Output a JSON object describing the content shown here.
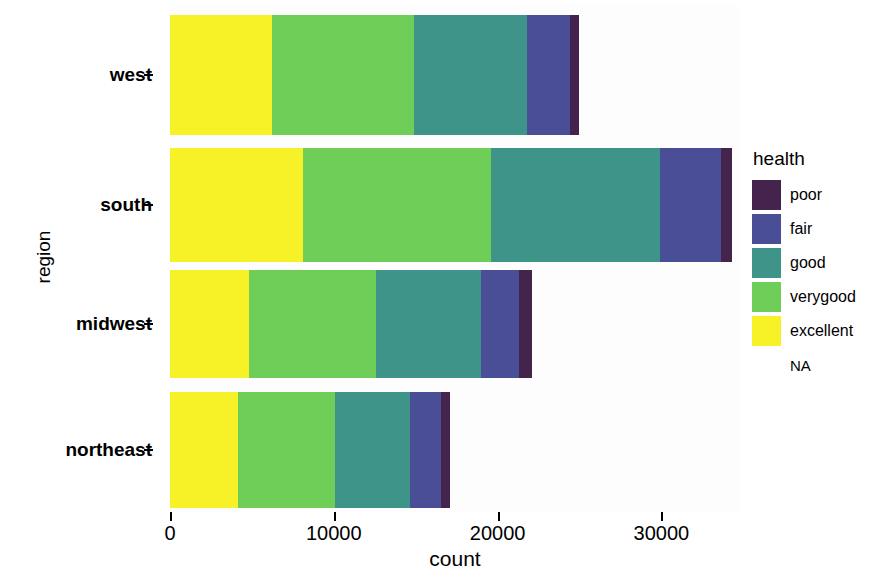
{
  "chart_data": {
    "type": "bar",
    "orientation": "horizontal",
    "stacked": true,
    "title": "",
    "xlabel": "count",
    "ylabel": "region",
    "categories": [
      "west",
      "south",
      "midwest",
      "northeast"
    ],
    "xlim": [
      0,
      34800
    ],
    "xticks": [
      0,
      10000,
      20000,
      30000
    ],
    "xtick_labels": [
      "0",
      "10000",
      "20000",
      "30000"
    ],
    "grid": false,
    "legend_title": "health",
    "legend_position": "right",
    "series": [
      {
        "name": "excellent",
        "color": "#F7F228",
        "values": [
          6200,
          8100,
          4800,
          4150
        ]
      },
      {
        "name": "verygood",
        "color": "#6ECE58",
        "values": [
          8700,
          11500,
          7800,
          5950
        ]
      },
      {
        "name": "good",
        "color": "#3E9489",
        "values": [
          6900,
          10300,
          6400,
          4550
        ]
      },
      {
        "name": "fair",
        "color": "#4A4E97",
        "values": [
          2650,
          3750,
          2300,
          1900
        ]
      },
      {
        "name": "poor",
        "color": "#44234C",
        "values": [
          550,
          650,
          800,
          550
        ]
      },
      {
        "name": "NA",
        "color": "transparent",
        "values": [
          0,
          0,
          0,
          0
        ]
      }
    ],
    "series_totals": [
      25000,
      34300,
      22100,
      17100
    ],
    "legend_entries": [
      {
        "label": "poor",
        "color": "#44234C",
        "has_swatch": true
      },
      {
        "label": "fair",
        "color": "#4A4E97",
        "has_swatch": true
      },
      {
        "label": "good",
        "color": "#3E9489",
        "has_swatch": true
      },
      {
        "label": "verygood",
        "color": "#6ECE58",
        "has_swatch": true
      },
      {
        "label": "excellent",
        "color": "#F7F228",
        "has_swatch": true
      },
      {
        "label": "NA",
        "color": "transparent",
        "has_swatch": false
      }
    ]
  }
}
